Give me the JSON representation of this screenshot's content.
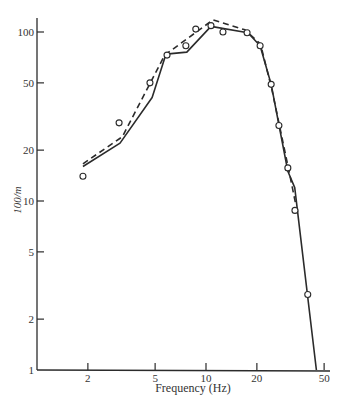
{
  "chart_data": {
    "type": "line",
    "title": "",
    "xlabel": "Frequency (Hz)",
    "ylabel": "100/m",
    "xscale": "log",
    "yscale": "log",
    "xlim": [
      1,
      50
    ],
    "ylim": [
      1,
      130
    ],
    "x_ticks": [
      2,
      5,
      10,
      20,
      50
    ],
    "x_tick_labels": [
      "2",
      "5",
      "10",
      "20",
      "50"
    ],
    "y_ticks": [
      1,
      2,
      5,
      10,
      20,
      50,
      100
    ],
    "y_tick_labels": [
      "1",
      "2",
      "5",
      "10",
      "20",
      "50",
      "100"
    ],
    "grid": false,
    "legend": null,
    "series": [
      {
        "name": "solid curve",
        "style": "solid",
        "points": [
          [
            1.87,
            16
          ],
          [
            3.1,
            22
          ],
          [
            4.8,
            41
          ],
          [
            5.8,
            74
          ],
          [
            7.7,
            76
          ],
          [
            10.7,
            108
          ],
          [
            17.7,
            99
          ],
          [
            20.9,
            83
          ],
          [
            24.3,
            49
          ],
          [
            30.5,
            15
          ],
          [
            33.5,
            12
          ],
          [
            45,
            1
          ]
        ]
      },
      {
        "name": "dashed curve",
        "style": "dashed",
        "points": [
          [
            1.87,
            16.6
          ],
          [
            3.2,
            24
          ],
          [
            5.7,
            73
          ],
          [
            11,
            118
          ],
          [
            17,
            103
          ],
          [
            21,
            85
          ],
          [
            24.5,
            46
          ],
          [
            31,
            15
          ],
          [
            34,
            9.5
          ]
        ]
      },
      {
        "name": "measured points",
        "style": "markers",
        "marker": "open-circle",
        "points": [
          [
            1.87,
            14
          ],
          [
            3.06,
            29
          ],
          [
            4.66,
            50
          ],
          [
            5.88,
            73
          ],
          [
            7.6,
            83
          ],
          [
            8.7,
            104
          ],
          [
            10.7,
            109
          ],
          [
            12.6,
            100
          ],
          [
            17.5,
            99
          ],
          [
            20.9,
            83
          ],
          [
            24.3,
            49
          ],
          [
            27,
            28
          ],
          [
            30.5,
            15.7
          ],
          [
            33.6,
            8.8
          ],
          [
            40,
            2.8
          ]
        ]
      }
    ]
  },
  "plot_area": {
    "origin_px": [
      37,
      370
    ],
    "px_per_decade": 169,
    "x_axis_end_px": 330,
    "y_axis_top_px": 18
  }
}
